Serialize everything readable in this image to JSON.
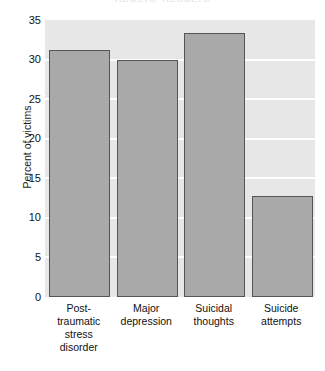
{
  "chart_data": {
    "type": "bar",
    "title": "ADULTS' RESULTS",
    "categories": [
      "Post-traumatic stress disorder",
      "Major depression",
      "Suicidal thoughts",
      "Suicide attempts"
    ],
    "category_lines": [
      [
        "Post-",
        "traumatic",
        "stress",
        "disorder"
      ],
      [
        "Major",
        "depression"
      ],
      [
        "Suicidal",
        "thoughts"
      ],
      [
        "Suicide",
        "attempts"
      ]
    ],
    "values": [
      31.2,
      30.0,
      33.4,
      12.8
    ],
    "xlabel": "",
    "ylabel": "Percent of victims",
    "ylim": [
      0,
      35
    ],
    "ytick_values": [
      0,
      5,
      10,
      15,
      20,
      25,
      30,
      35
    ],
    "ytick_labels": [
      "0",
      "5",
      "10",
      "15",
      "20",
      "25",
      "30",
      "35"
    ],
    "grid": true,
    "grid_axis": "y",
    "legend": false,
    "colors": {
      "bar_fill": "#a9a9a9",
      "bar_edge": "#555555",
      "plot_background": "#e7e7e7",
      "gridline": "#ffffff",
      "figure_background": "#ffffff",
      "text": "#111111"
    }
  }
}
